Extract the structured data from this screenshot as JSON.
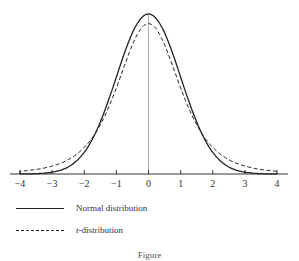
{
  "chart_data": {
    "type": "line",
    "title": "",
    "xlabel": "",
    "ylabel": "",
    "xlim": [
      -4,
      4
    ],
    "x_ticks": [
      "−4",
      "−3",
      "−2",
      "−1",
      "0",
      "1",
      "2",
      "3",
      "4"
    ],
    "grid": false,
    "series": [
      {
        "name": "Normal distribution",
        "style": "solid",
        "peak": 0.399,
        "sd": 1
      },
      {
        "name": "t-distribution",
        "style": "dashed",
        "peak": 0.37,
        "df": 4
      }
    ],
    "legend_position": "below"
  },
  "legend": {
    "normal": "Normal distribution",
    "t_italic": "t",
    "t_rest": "-distribution"
  },
  "caption": "Figure"
}
